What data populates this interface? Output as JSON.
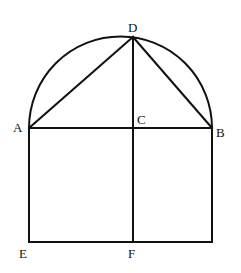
{
  "diagram": {
    "type": "geometry",
    "stroke_color": "#111111",
    "background": "#ffffff",
    "points": {
      "A": {
        "label": "A",
        "x": 29,
        "y": 128
      },
      "B": {
        "label": "B",
        "x": 212,
        "y": 128
      },
      "C": {
        "label": "C",
        "x": 133,
        "y": 128
      },
      "D": {
        "label": "D",
        "x": 133,
        "y": 37
      },
      "E": {
        "label": "E",
        "x": 29,
        "y": 242
      },
      "F": {
        "label": "F",
        "x": 133,
        "y": 242
      }
    },
    "segments": [
      [
        "A",
        "B"
      ],
      [
        "A",
        "D"
      ],
      [
        "D",
        "B"
      ],
      [
        "D",
        "F"
      ],
      [
        "A",
        "E"
      ],
      [
        "E",
        "F"
      ],
      [
        "F",
        "G"
      ],
      [
        "B",
        "G"
      ]
    ],
    "arc": {
      "from": "A",
      "to": "B",
      "type": "semicircle-above"
    },
    "labels": {
      "A": "A",
      "B": "B",
      "C": "C",
      "D": "D",
      "E": "E",
      "F": "F"
    }
  }
}
